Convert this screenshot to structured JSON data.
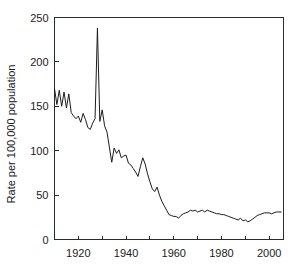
{
  "chart_data": {
    "type": "line",
    "title": "",
    "xlabel": "",
    "ylabel": "Rate per 100,000 population",
    "xlim": [
      1910,
      2006
    ],
    "ylim": [
      0,
      250
    ],
    "grid": false,
    "legend": "none",
    "y_ticks": [
      0,
      50,
      100,
      150,
      200,
      250
    ],
    "y_tick_labels": [
      "0",
      "50",
      "100",
      "150",
      "200",
      "250"
    ],
    "x_ticks": [
      1920,
      1940,
      1960,
      1980,
      2000
    ],
    "x_tick_labels": [
      "1920",
      "1940",
      "1960",
      "1980",
      "2000"
    ],
    "x_minor_ticks": [
      1910,
      1930,
      1950,
      1970,
      1990,
      2000
    ],
    "series": [
      {
        "name": "Rate per 100,000 population",
        "color": "#1c1c1c",
        "x": [
          1910,
          1911,
          1912,
          1913,
          1914,
          1915,
          1916,
          1917,
          1918,
          1919,
          1920,
          1921,
          1922,
          1923,
          1924,
          1925,
          1926,
          1927,
          1928,
          1929,
          1930,
          1931,
          1932,
          1933,
          1934,
          1935,
          1936,
          1937,
          1938,
          1939,
          1940,
          1941,
          1942,
          1943,
          1944,
          1945,
          1946,
          1947,
          1948,
          1949,
          1950,
          1951,
          1952,
          1953,
          1954,
          1955,
          1956,
          1957,
          1958,
          1959,
          1960,
          1961,
          1962,
          1963,
          1964,
          1965,
          1966,
          1967,
          1968,
          1969,
          1970,
          1971,
          1972,
          1973,
          1974,
          1975,
          1976,
          1977,
          1978,
          1979,
          1980,
          1981,
          1982,
          1983,
          1984,
          1985,
          1986,
          1987,
          1988,
          1989,
          1990,
          1991,
          1992,
          1993,
          1994,
          1995,
          1996,
          1997,
          1998,
          1999,
          2000,
          2001,
          2002,
          2003,
          2004,
          2005
        ],
        "values": [
          170,
          152,
          168,
          150,
          166,
          148,
          164,
          143,
          139,
          136,
          139,
          132,
          142,
          135,
          126,
          124,
          131,
          136,
          238,
          133,
          146,
          128,
          121,
          104,
          87,
          103,
          97,
          101,
          92,
          94,
          95,
          86,
          84,
          80,
          76,
          71,
          82,
          92,
          85,
          74,
          65,
          57,
          54,
          59,
          50,
          43,
          38,
          33,
          28,
          27,
          26,
          26,
          24,
          27,
          29,
          30,
          31,
          33,
          32,
          33,
          31,
          32,
          33,
          31,
          33,
          32,
          31,
          30,
          29,
          29,
          28,
          28,
          27,
          26,
          25,
          24,
          23,
          22,
          24,
          21,
          22,
          20,
          21,
          23,
          25,
          27,
          28,
          29,
          30,
          30,
          30,
          29,
          30,
          31,
          31,
          31
        ]
      }
    ]
  },
  "axes": {
    "ylabel": "Rate per 100,000 population"
  }
}
